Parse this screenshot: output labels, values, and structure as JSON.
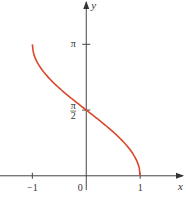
{
  "chart_data": {
    "type": "line",
    "title": "",
    "function": "y = arccos(x)",
    "xlabel": "x",
    "ylabel": "y",
    "xlim": [
      -1.6,
      1.85
    ],
    "ylim": [
      -0.65,
      4.2
    ],
    "grid": false,
    "x_ticks": [
      {
        "value": -1,
        "label": "−1"
      },
      {
        "value": 0,
        "label": "0"
      },
      {
        "value": 1,
        "label": "1"
      }
    ],
    "y_ticks": [
      {
        "value": 3.14159,
        "label": "π"
      },
      {
        "value": 1.5708,
        "label": "π/2"
      }
    ],
    "series": [
      {
        "name": "arccos",
        "color": "#d9472b",
        "domain": [
          -1,
          1
        ],
        "x": [
          -1,
          -0.9,
          -0.75,
          -0.5,
          -0.25,
          0,
          0.25,
          0.5,
          0.75,
          0.9,
          1
        ],
        "y": [
          3.1416,
          2.6906,
          2.4189,
          2.0944,
          1.8235,
          1.5708,
          1.3181,
          1.0472,
          0.7227,
          0.451,
          0
        ]
      }
    ]
  }
}
